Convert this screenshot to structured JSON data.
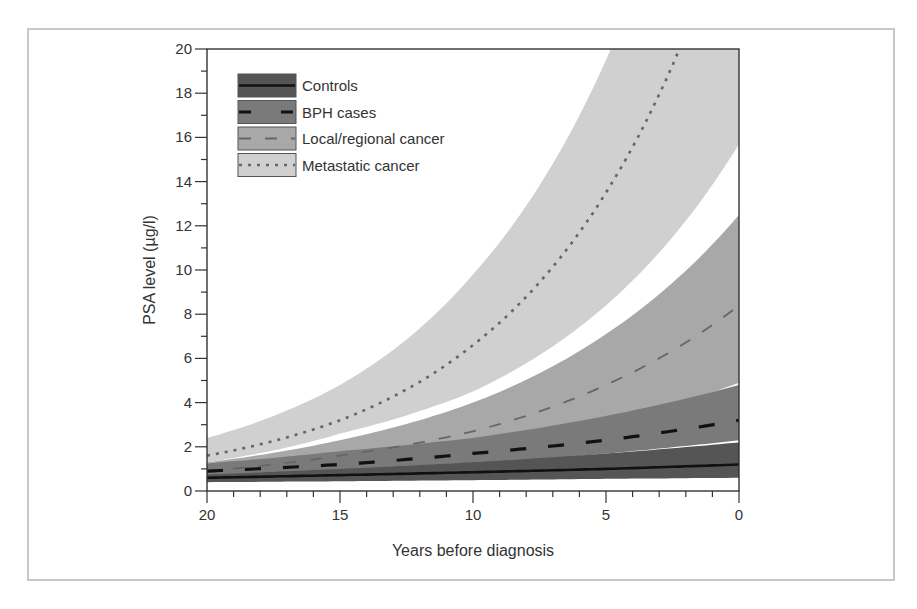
{
  "chart_data": {
    "type": "line",
    "title": "",
    "xlabel": "Years before diagnosis",
    "ylabel": "PSA level (µg/l)",
    "xlim": [
      20,
      0
    ],
    "ylim": [
      0,
      20
    ],
    "x_ticks": [
      20,
      15,
      10,
      5,
      0
    ],
    "x_minor_step": 1,
    "y_ticks": [
      0,
      2,
      4,
      6,
      8,
      10,
      12,
      14,
      16,
      18,
      20
    ],
    "y_minor_step": 1,
    "grid": false,
    "legend_position": "upper-left",
    "x": [
      20,
      15,
      10,
      5,
      0
    ],
    "series": [
      {
        "name": "Controls",
        "line_style": "solid",
        "band_color": "#555555",
        "line_color": "#111111",
        "values": [
          0.6,
          0.72,
          0.85,
          1.0,
          1.2
        ],
        "lower": [
          0.4,
          0.44,
          0.49,
          0.55,
          0.6
        ],
        "upper": [
          0.75,
          1.0,
          1.3,
          1.7,
          2.2
        ]
      },
      {
        "name": "BPH cases",
        "line_style": "long-dash",
        "band_color": "#7a7a7a",
        "line_color": "#111111",
        "values": [
          0.9,
          1.2,
          1.7,
          2.3,
          3.2
        ],
        "lower": [
          0.6,
          0.86,
          1.2,
          1.7,
          2.3
        ],
        "upper": [
          1.25,
          1.8,
          2.4,
          3.4,
          4.8
        ]
      },
      {
        "name": "Local/regional cancer",
        "line_style": "dash",
        "band_color": "#a8a8a8",
        "line_color": "#666666",
        "values": [
          0.9,
          1.6,
          2.7,
          4.8,
          8.4
        ],
        "lower": [
          0.8,
          1.2,
          1.9,
          3.1,
          4.9
        ],
        "upper": [
          1.3,
          2.3,
          4.0,
          7.1,
          12.5
        ]
      },
      {
        "name": "Metastatic cancer",
        "line_style": "dotted",
        "band_color": "#d0d0d0",
        "line_color": "#666666",
        "values": [
          1.6,
          3.2,
          6.6,
          13.5,
          27.5
        ],
        "lower": [
          1.3,
          2.6,
          4.5,
          8.4,
          15.7
        ],
        "upper": [
          2.4,
          4.8,
          9.8,
          19.5,
          39.0
        ]
      }
    ]
  }
}
